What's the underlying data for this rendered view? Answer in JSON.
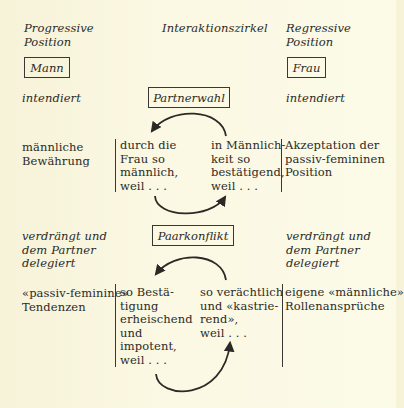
{
  "header": {
    "left": [
      "Progressive",
      "Position"
    ],
    "center": "Interaktionszirkel",
    "right": [
      "Regressive",
      "Position"
    ]
  },
  "roles": {
    "left": "Mann",
    "right": "Frau"
  },
  "section1": {
    "label_left": "intendiert",
    "label_right": "intendiert",
    "phase": "Partnerwahl",
    "left_col": [
      "männliche",
      "Bewährung"
    ],
    "circle_left": [
      "durch die",
      "Frau so",
      "männlich,",
      "weil . . ."
    ],
    "circle_right": [
      "in Männlich-",
      "keit so",
      "bestätigend,",
      "weil . . ."
    ],
    "right_col": [
      "Akzeptation der",
      "passiv-femininen",
      "Position"
    ]
  },
  "section2": {
    "label_left": [
      "verdrängt und",
      "dem Partner",
      "delegiert"
    ],
    "label_right": [
      "verdrängt und",
      "dem Partner",
      "delegiert"
    ],
    "phase": "Paarkonflikt",
    "left_col": [
      "«passiv-feminine»",
      "Tendenzen"
    ],
    "circle_left": [
      "so Bestä-",
      "tigung",
      "erheischend",
      "und",
      "impotent,",
      "weil . . ."
    ],
    "circle_right": [
      "so verächtlich",
      "und «kastrie-",
      "rend»,",
      "weil . . ."
    ],
    "right_col": [
      "eigene «männliche»",
      "Rollenansprüche"
    ]
  },
  "colors": {
    "ink": "#2b2a26",
    "paper": "#fbf8e3"
  }
}
